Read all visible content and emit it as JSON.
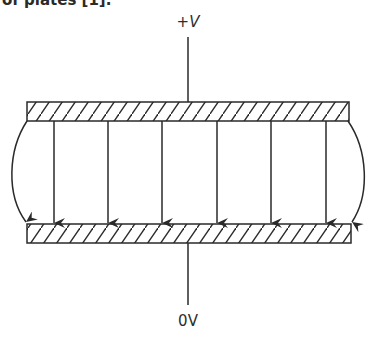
{
  "caption": {
    "text": "of plates [1]."
  },
  "diagram": {
    "top_terminal": {
      "sign": "+",
      "symbol": "V"
    },
    "bottom_terminal": {
      "label": "0V"
    },
    "colors": {
      "stroke": "#2a2a2a",
      "background": "#ffffff"
    },
    "top_plate": {
      "x": 27,
      "y": 102,
      "width": 322,
      "height": 19
    },
    "bottom_plate": {
      "x": 27,
      "y": 224,
      "width": 324,
      "height": 19
    },
    "field_lines_x": [
      54,
      108,
      162,
      217,
      271,
      326
    ],
    "fringe_lines": [
      "left",
      "right"
    ]
  }
}
